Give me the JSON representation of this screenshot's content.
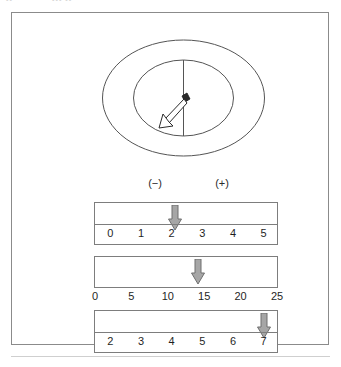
{
  "page": {
    "header_ghost_left": "••",
    "header_ghost_right": "•••  ••"
  },
  "figure": {
    "title": "",
    "dial": {
      "name": "analog-meter-dial",
      "outer_shape": "ellipse",
      "inner_shape": "ellipse",
      "center_line": "vertical",
      "needle": "pointer-arrow",
      "needle_direction": "down-left",
      "stroke_color": "#555555"
    },
    "polarity": {
      "negative_label": "(−)",
      "positive_label": "(+)"
    },
    "scales": [
      {
        "name": "scale-0-to-5",
        "labels_position": "inside",
        "ticks": [
          "0",
          "1",
          "2",
          "3",
          "4",
          "5"
        ],
        "min": 0,
        "max": 5,
        "pointer_value": 2.1,
        "pointer_color": "#a6a6a6"
      },
      {
        "name": "scale-0-to-25",
        "labels_position": "outside",
        "ticks": [
          "0",
          "5",
          "10",
          "15",
          "20",
          "25"
        ],
        "min": 0,
        "max": 25,
        "pointer_value": 14.0,
        "pointer_color": "#a6a6a6"
      },
      {
        "name": "scale-2-to-7",
        "labels_position": "inside",
        "ticks": [
          "2",
          "3",
          "4",
          "5",
          "6",
          "7"
        ],
        "min": 2,
        "max": 7,
        "pointer_value": 7.0,
        "pointer_color": "#a6a6a6"
      }
    ]
  },
  "colors": {
    "frame": "#8b8b8b",
    "bar_stroke": "#7d7d7d",
    "arrow_fill": "#a6a6a6",
    "arrow_stroke": "#6f6f6f",
    "text": "#1f1f1f",
    "dial_stroke": "#555555"
  }
}
